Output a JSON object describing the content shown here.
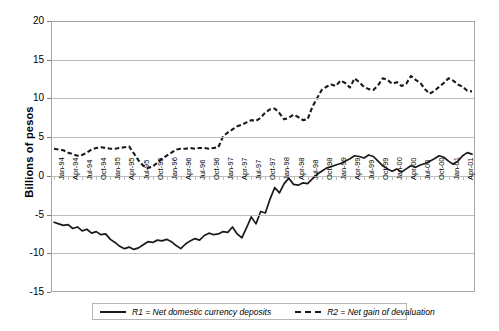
{
  "chart_data": {
    "type": "line",
    "title": "",
    "xlabel": "",
    "ylabel": "Billions of pesos",
    "ylim": [
      -15,
      20
    ],
    "yticks": [
      20,
      15,
      10,
      5,
      0,
      -5,
      -10,
      -15
    ],
    "grid": true,
    "legend_position": "bottom",
    "categories": [
      "Jan-94",
      "Feb-94",
      "Mar-94",
      "Apr-94",
      "May-94",
      "Jun-94",
      "Jul-94",
      "Aug-94",
      "Sep-94",
      "Oct-94",
      "Nov-94",
      "Dec-94",
      "Jan-95",
      "Feb-95",
      "Mar-95",
      "Apr-95",
      "May-95",
      "Jun-95",
      "Jul-95",
      "Aug-95",
      "Sep-95",
      "Oct-95",
      "Nov-95",
      "Dec-95",
      "Jan-96",
      "Feb-96",
      "Mar-96",
      "Apr-96",
      "May-96",
      "Jun-96",
      "Jul-96",
      "Aug-96",
      "Sep-96",
      "Oct-96",
      "Nov-96",
      "Dec-96",
      "Jan-97",
      "Feb-97",
      "Mar-97",
      "Apr-97",
      "May-97",
      "Jun-97",
      "Jul-97",
      "Aug-97",
      "Sep-97",
      "Oct-97",
      "Nov-97",
      "Dec-97",
      "Jan-98",
      "Feb-98",
      "Mar-98",
      "Apr-98",
      "May-98",
      "Jun-98",
      "Jul-98",
      "Aug-98",
      "Sep-98",
      "Oct-98",
      "Nov-98",
      "Dec-98",
      "Jan-99",
      "Feb-99",
      "Mar-99",
      "Apr-99",
      "May-99",
      "Jun-99",
      "Jul-99",
      "Aug-99",
      "Sep-99",
      "Oct-99",
      "Nov-99",
      "Dec-99",
      "Jan-00",
      "Feb-00",
      "Mar-00",
      "Apr-00",
      "May-00",
      "Jun-00",
      "Jul-00",
      "Aug-00",
      "Sep-00",
      "Oct-00",
      "Nov-00",
      "Dec-00",
      "Jan-01",
      "Feb-01",
      "Mar-01",
      "Apr-01",
      "May-01",
      "Jun-01"
    ],
    "xtick_labels": [
      "Jan-94",
      "Apr-94",
      "Jul-94",
      "Oct-94",
      "Jan-95",
      "Apr-95",
      "Jul-95",
      "Oct-95",
      "Jan-96",
      "Apr-96",
      "Jul-96",
      "Oct-96",
      "Jan-97",
      "Apr-97",
      "Jul-97",
      "Oct-97",
      "Jan-98",
      "Apr-98",
      "Jul-98",
      "Oct-98",
      "Jan-99",
      "Apr-99",
      "Jul-99",
      "Oct-99",
      "Jan-00",
      "Apr-00",
      "Jul-00",
      "Oct-00",
      "Jan-01",
      "Apr-01"
    ],
    "series": [
      {
        "name": "R1 = Net domestic currency deposits",
        "style": "solid",
        "color": "#1a1a1a",
        "values": [
          -6.0,
          -6.2,
          -6.4,
          -6.3,
          -6.8,
          -6.6,
          -7.1,
          -6.9,
          -7.4,
          -7.2,
          -7.6,
          -7.5,
          -8.2,
          -8.6,
          -9.1,
          -9.4,
          -9.2,
          -9.5,
          -9.3,
          -8.9,
          -8.5,
          -8.6,
          -8.3,
          -8.4,
          -8.2,
          -8.5,
          -9.0,
          -9.4,
          -8.8,
          -8.4,
          -8.1,
          -8.3,
          -7.7,
          -7.4,
          -7.6,
          -7.5,
          -7.2,
          -7.3,
          -6.6,
          -7.5,
          -8.0,
          -6.7,
          -5.3,
          -6.2,
          -4.6,
          -4.8,
          -3.0,
          -1.5,
          -2.2,
          -1.0,
          -0.3,
          -1.1,
          -1.2,
          -0.9,
          -1.0,
          -0.4,
          0.2,
          0.6,
          1.0,
          1.2,
          1.4,
          1.6,
          1.9,
          2.2,
          2.6,
          2.5,
          2.3,
          2.7,
          2.5,
          1.9,
          1.3,
          0.9,
          0.6,
          0.9,
          0.5,
          0.9,
          1.3,
          1.1,
          1.4,
          1.6,
          1.9,
          2.2,
          2.6,
          2.4,
          1.9,
          1.5,
          1.9,
          2.6,
          3.0,
          2.8
        ]
      },
      {
        "name": "R2 = Net gain of devaluation",
        "style": "dashed",
        "color": "#1a1a1a",
        "values": [
          3.5,
          3.4,
          3.3,
          3.0,
          2.8,
          2.6,
          2.7,
          3.0,
          3.4,
          3.6,
          3.7,
          3.6,
          3.5,
          3.5,
          3.6,
          3.7,
          3.8,
          2.9,
          2.0,
          1.3,
          1.0,
          1.2,
          1.7,
          2.2,
          2.6,
          3.0,
          3.4,
          3.5,
          3.5,
          3.6,
          3.5,
          3.6,
          3.6,
          3.5,
          3.6,
          3.7,
          5.1,
          5.6,
          6.0,
          6.4,
          6.6,
          6.9,
          7.2,
          7.1,
          7.5,
          8.2,
          8.6,
          8.7,
          8.1,
          7.3,
          7.5,
          7.9,
          7.6,
          7.2,
          7.3,
          8.9,
          10.0,
          11.1,
          11.5,
          11.8,
          11.6,
          12.3,
          12.0,
          11.4,
          12.6,
          12.1,
          11.5,
          11.2,
          11.1,
          11.7,
          12.6,
          12.4,
          11.9,
          12.1,
          11.6,
          11.9,
          12.9,
          12.4,
          12.0,
          11.2,
          10.6,
          11.0,
          11.5,
          12.0,
          12.6,
          12.3,
          11.8,
          11.5,
          11.0,
          10.9
        ]
      }
    ]
  },
  "legend": {
    "item1": "R1 = Net domestic currency deposits",
    "item2": "R2 = Net gain of devaluation"
  }
}
